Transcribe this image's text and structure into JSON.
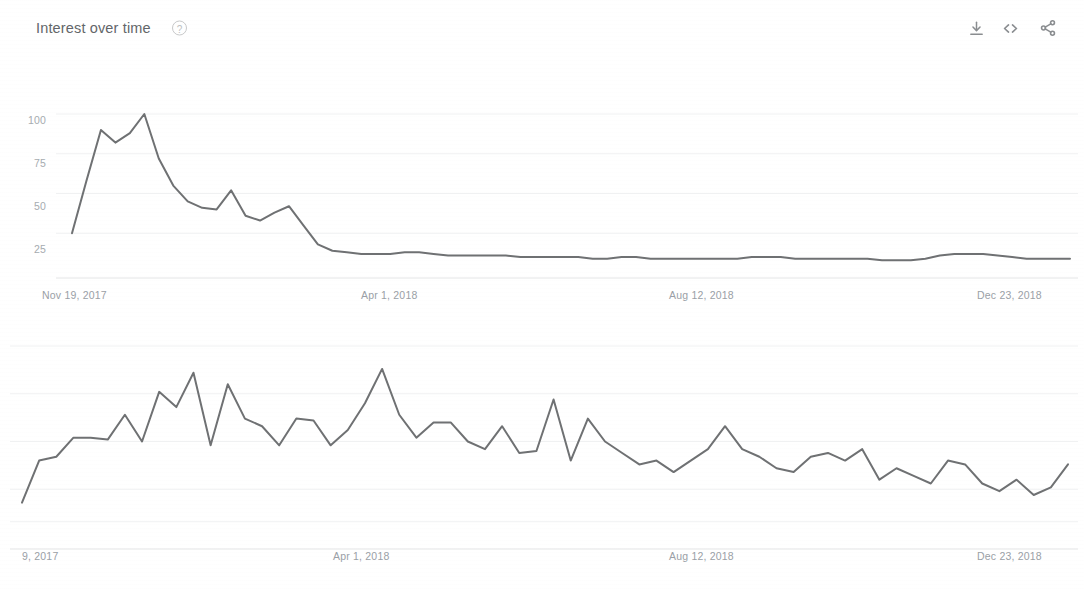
{
  "header": {
    "title": "Interest over time",
    "help_icon": "question-mark-icon",
    "download_icon": "download-icon",
    "embed_icon": "embed-code-icon",
    "share_icon": "share-icon"
  },
  "colors": {
    "line": "#6f7173",
    "gridline": "#f0f1f2",
    "axis_text": "#9aa0a6",
    "title_text": "#636669",
    "background": "#ffffff"
  },
  "chart_data": [
    {
      "type": "line",
      "title": "Interest over time",
      "xlabel": "",
      "ylabel": "",
      "ylim": [
        0,
        100
      ],
      "grid": true,
      "legend": "none",
      "ytick_labels": [
        "100",
        "75",
        "50",
        "25"
      ],
      "ytick_values": [
        100,
        75,
        50,
        25
      ],
      "xtick_labels": [
        "Nov 19, 2017",
        "Apr 1, 2018",
        "Aug 12, 2018",
        "Dec 23, 2018"
      ],
      "xtick_positions": [
        0,
        0.315,
        0.632,
        0.955
      ],
      "series": [
        {
          "name": "Search interest",
          "values": [
            25,
            58,
            90,
            82,
            88,
            100,
            72,
            55,
            45,
            41,
            40,
            52,
            36,
            33,
            38,
            42,
            30,
            18,
            14,
            13,
            12,
            12,
            12,
            13,
            13,
            12,
            11,
            11,
            11,
            11,
            11,
            10,
            10,
            10,
            10,
            10,
            9,
            9,
            10,
            10,
            9,
            9,
            9,
            9,
            9,
            9,
            9,
            10,
            10,
            10,
            9,
            9,
            9,
            9,
            9,
            9,
            8,
            8,
            8,
            9,
            11,
            12,
            12,
            12,
            11,
            10,
            9,
            9,
            9,
            9
          ]
        }
      ]
    },
    {
      "type": "line",
      "title": "",
      "xlabel": "",
      "ylabel": "",
      "ylim": [
        0,
        100
      ],
      "grid": true,
      "legend": "none",
      "ytick_labels": [],
      "xtick_labels": [
        "9, 2017",
        "Apr 1, 2018",
        "Aug 12, 2018",
        "Dec 23, 2018"
      ],
      "xtick_positions": [
        0,
        0.315,
        0.632,
        0.955
      ],
      "series": [
        {
          "name": "Search interest (zoomed)",
          "values": [
            18,
            40,
            42,
            52,
            52,
            51,
            64,
            50,
            76,
            68,
            86,
            48,
            80,
            62,
            58,
            48,
            62,
            61,
            48,
            56,
            70,
            88,
            64,
            52,
            60,
            60,
            50,
            46,
            58,
            44,
            45,
            72,
            40,
            62,
            50,
            44,
            38,
            40,
            34,
            40,
            46,
            58,
            46,
            42,
            36,
            34,
            42,
            44,
            40,
            46,
            30,
            36,
            32,
            28,
            40,
            38,
            28,
            24,
            30,
            22,
            26,
            38
          ]
        }
      ]
    }
  ]
}
